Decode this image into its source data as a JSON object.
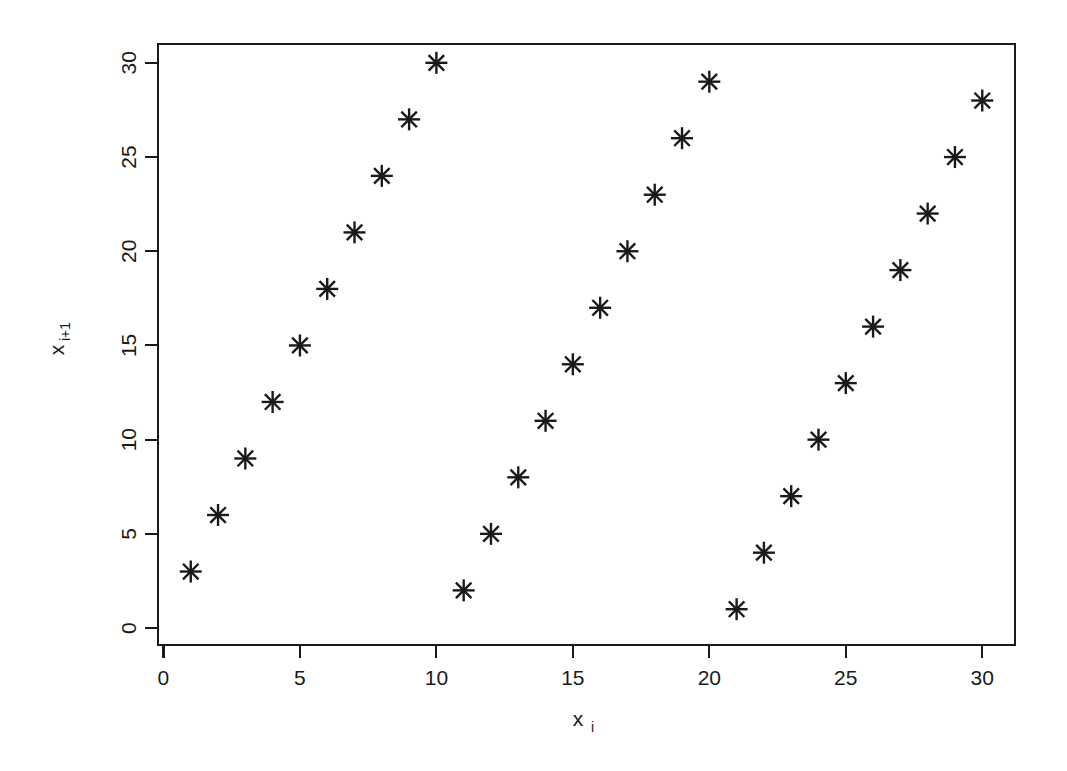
{
  "chart_data": {
    "type": "scatter",
    "title": "",
    "subtitle": "",
    "xlabel": "x_i",
    "xlabel_base": "x",
    "xlabel_subscript": "i",
    "ylabel": "x_i+1",
    "ylabel_base": "x",
    "ylabel_subscript": "i+1",
    "xlim": [
      -0.2,
      31.2
    ],
    "ylim": [
      -0.9,
      31.0
    ],
    "xticks": [
      0,
      5,
      10,
      15,
      20,
      25,
      30
    ],
    "xtick_labels": [
      "0",
      "5",
      "10",
      "15",
      "20",
      "25",
      "30"
    ],
    "yticks": [
      0,
      5,
      10,
      15,
      20,
      25,
      30
    ],
    "ytick_labels": [
      "0",
      "5",
      "10",
      "15",
      "20",
      "25",
      "30"
    ],
    "grid": false,
    "legend": false,
    "legend_position": "none",
    "marker": "asterisk",
    "marker_color": "#1a1a1a",
    "frame": "box",
    "x": [
      1,
      2,
      3,
      4,
      5,
      6,
      7,
      8,
      9,
      10,
      11,
      12,
      13,
      14,
      15,
      16,
      17,
      18,
      19,
      20,
      21,
      22,
      23,
      24,
      25,
      26,
      27,
      28,
      29,
      30
    ],
    "y": [
      3,
      6,
      9,
      12,
      15,
      18,
      21,
      24,
      27,
      30,
      2,
      5,
      8,
      11,
      14,
      17,
      20,
      23,
      26,
      29,
      1,
      4,
      7,
      10,
      13,
      16,
      19,
      22,
      25,
      28
    ],
    "points": [
      [
        1,
        3
      ],
      [
        2,
        6
      ],
      [
        3,
        9
      ],
      [
        4,
        12
      ],
      [
        5,
        15
      ],
      [
        6,
        18
      ],
      [
        7,
        21
      ],
      [
        8,
        24
      ],
      [
        9,
        27
      ],
      [
        10,
        30
      ],
      [
        11,
        2
      ],
      [
        12,
        5
      ],
      [
        13,
        8
      ],
      [
        14,
        11
      ],
      [
        15,
        14
      ],
      [
        16,
        17
      ],
      [
        17,
        20
      ],
      [
        18,
        23
      ],
      [
        19,
        26
      ],
      [
        20,
        29
      ],
      [
        21,
        1
      ],
      [
        22,
        4
      ],
      [
        23,
        7
      ],
      [
        24,
        10
      ],
      [
        25,
        13
      ],
      [
        26,
        16
      ],
      [
        27,
        19
      ],
      [
        28,
        22
      ],
      [
        29,
        25
      ],
      [
        30,
        28
      ]
    ]
  }
}
